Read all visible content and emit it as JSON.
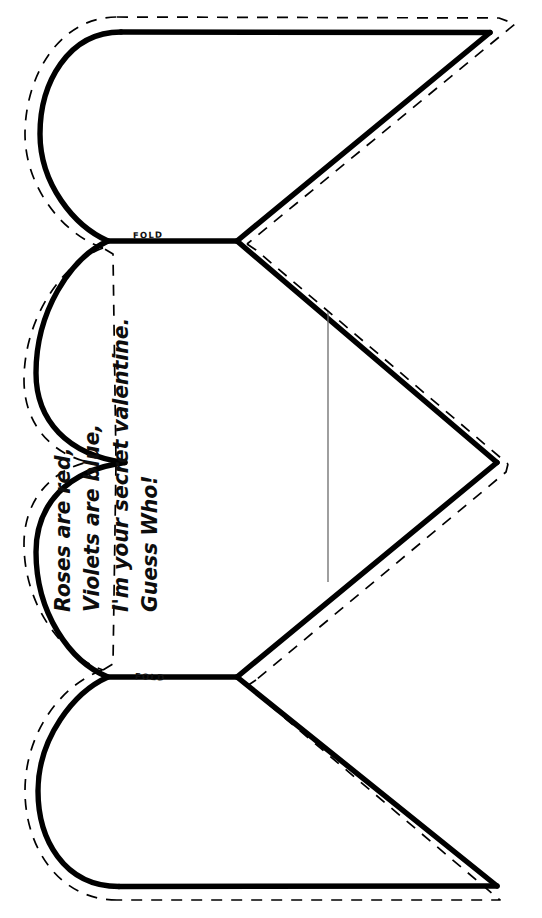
{
  "document": {
    "title": "Valentine Heart Fold-Out Card Template",
    "background_color": "#ffffff",
    "width": 542,
    "height": 918
  },
  "style": {
    "cut_line_color": "#000000",
    "cut_line_width": 5.2,
    "dashed_line_color": "#000000",
    "dashed_line_width": 1.6,
    "dash_pattern": "11 9",
    "fold_line_color": "#000000",
    "fold_line_width": 1.3,
    "signature_line_color": "#6b6b6b",
    "signature_line_width": 1.2,
    "text_color": "#0d0d0d"
  },
  "poem": {
    "rotation_degrees": -90,
    "lines": [
      "Roses are red,",
      "Violets are blue,",
      "I'm your secret valentine.",
      "Guess Who!"
    ]
  },
  "fold_lines": [
    {
      "label": "FOLD",
      "y": 241,
      "x_start": 108,
      "x_end": 237
    },
    {
      "label": "FOLD",
      "y": 677,
      "x_start": 108,
      "x_end": 237
    }
  ],
  "signature_line": {
    "x": 328,
    "y_start": 312,
    "y_end": 582
  },
  "geometry": {
    "cut_path": "M120.5,31.5 L490,32 L236.5,241 L497,462.5 L236.5,677 L490,886.5 L118.5,886.5 C65,886.5 36,837 36,790 C36,735 70,690 108,677 L125,462.5 L108,241 C70,228 40,186 40,136 C40,84 72,31.5 120.5,31.5 Z",
    "seam_offset_px": 9,
    "lobes": 3,
    "notch_tips": [
      {
        "x": 236,
        "y": 241
      },
      {
        "x": 125,
        "y": 462
      },
      {
        "x": 236,
        "y": 677
      }
    ],
    "right_tip": {
      "x": 497,
      "y": 462
    }
  }
}
